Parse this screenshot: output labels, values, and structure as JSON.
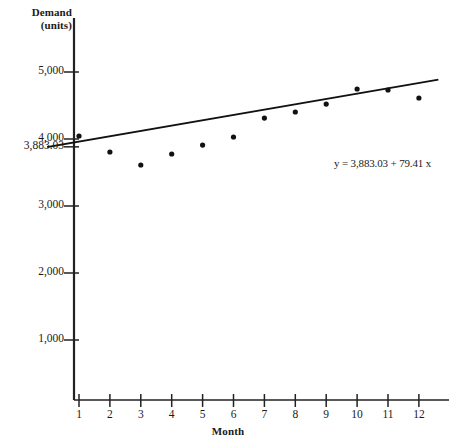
{
  "chart_data": {
    "type": "scatter",
    "title": "",
    "xlabel": "Month",
    "ylabel": "Demand (units)",
    "ylabel_lines": [
      "Demand",
      "(units)"
    ],
    "x": [
      1,
      2,
      3,
      4,
      5,
      6,
      7,
      8,
      9,
      10,
      11,
      12
    ],
    "categories": [
      "1",
      "2",
      "3",
      "4",
      "5",
      "6",
      "7",
      "8",
      "9",
      "10",
      "11",
      "12"
    ],
    "values": [
      4045,
      3806,
      3612,
      3776,
      3910,
      4030,
      4313,
      4403,
      4522,
      4746,
      4731,
      4612
    ],
    "series": [
      {
        "name": "Demand",
        "values": [
          4045,
          3806,
          3612,
          3776,
          3910,
          4030,
          4313,
          4403,
          4522,
          4746,
          4731,
          4612
        ]
      }
    ],
    "trendline": {
      "type": "line",
      "equation": "y = 3,883.03 + 79.41 x",
      "intercept": 3883.03,
      "slope": 79.41,
      "x_start": 0,
      "x_end": 12.6,
      "y_start": 3883.03,
      "y_end": 4883.6
    },
    "annotations": [
      {
        "name": "regression-equation",
        "text": "y = 3,883.03 + 79.41 x",
        "x_px": 334,
        "y_px": 164
      }
    ],
    "xlim": [
      0,
      12.6
    ],
    "ylim": [
      0,
      5500
    ],
    "ytick_values": [
      1000,
      2000,
      3000,
      4000,
      5000
    ],
    "ytick_labels": [
      "1,000",
      "2,000",
      "3,000",
      "4,000",
      "5,000"
    ],
    "special_ytick": {
      "value": 3883.03,
      "label": "3,883.03"
    },
    "xtick_labels": [
      "1",
      "2",
      "3",
      "4",
      "5",
      "6",
      "7",
      "8",
      "9",
      "10",
      "11",
      "12"
    ],
    "grid": false,
    "legend": "none",
    "marker_color": "#111111",
    "line_color": "#111111",
    "axis_color": "#222222",
    "background_color": "#ffffff"
  },
  "geometry": {
    "axis_x_px": 74,
    "axis_y_px": 400,
    "y_zero_px": 407,
    "px_per_unit": 0.067,
    "px_per_month": 30.9,
    "x_origin_px": 79
  }
}
